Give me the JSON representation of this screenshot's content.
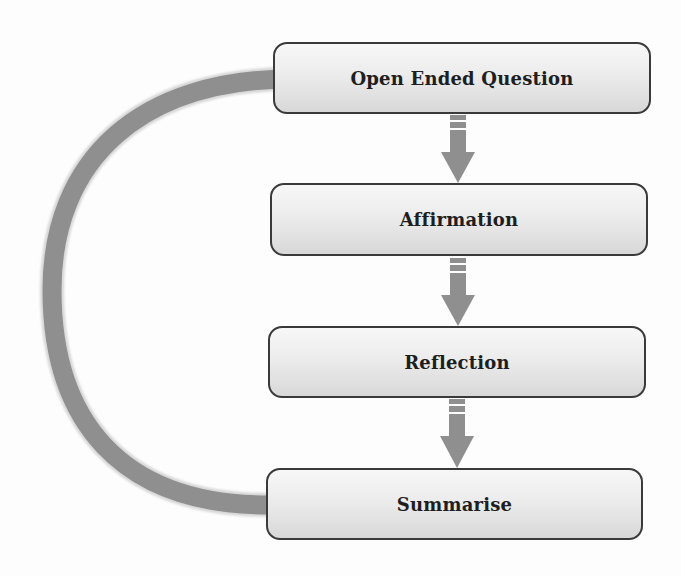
{
  "diagram": {
    "type": "cycle-flowchart",
    "colors": {
      "arrow": "#8f8f8f",
      "box_border": "#3a3a3a",
      "box_fill_top": "#f7f7f7",
      "box_fill_bottom": "#d8d8d8",
      "text": "#1e1e1e"
    },
    "steps": [
      {
        "label": "Open Ended Question"
      },
      {
        "label": "Affirmation"
      },
      {
        "label": "Reflection"
      },
      {
        "label": "Summarise"
      }
    ],
    "connections": [
      {
        "from": "Open Ended Question",
        "to": "Affirmation",
        "style": "dashed-down-arrow"
      },
      {
        "from": "Affirmation",
        "to": "Reflection",
        "style": "dashed-down-arrow"
      },
      {
        "from": "Reflection",
        "to": "Summarise",
        "style": "dashed-down-arrow"
      },
      {
        "from": "Summarise",
        "to": "Open Ended Question",
        "style": "curved-loop-arrow"
      }
    ]
  }
}
